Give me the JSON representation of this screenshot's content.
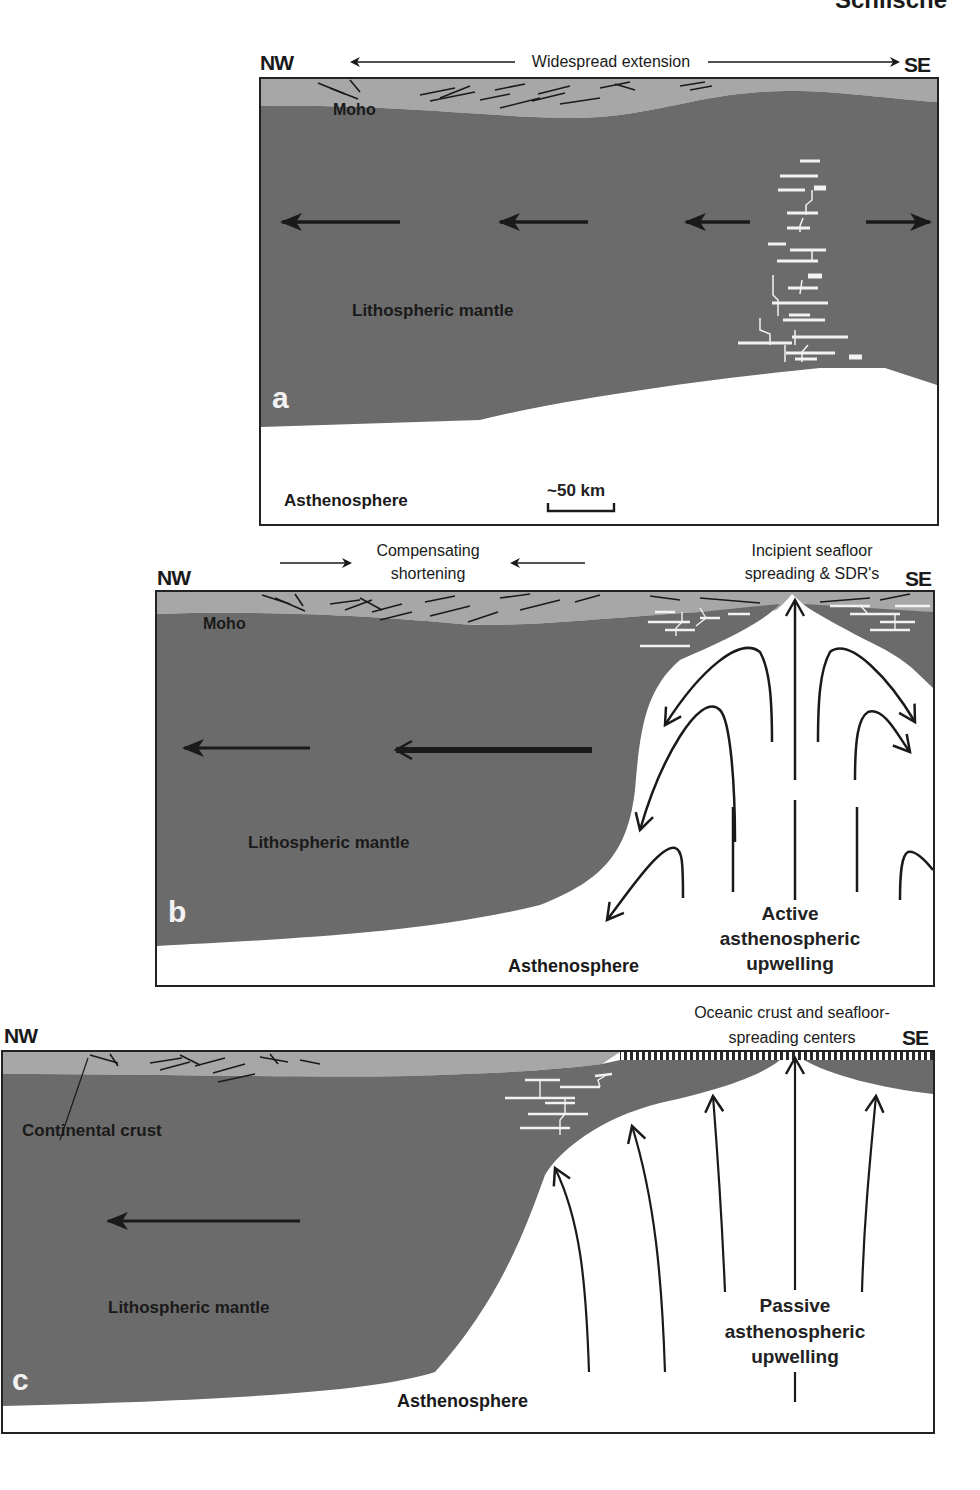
{
  "page_header_fragment": "Schlische",
  "colors": {
    "upper_crust": "#a7a7a7",
    "lithospheric_mantle": "#6b6b6b",
    "asthenosphere": "#ffffff",
    "frame": "#222222",
    "intrusion": "#f2f2f2"
  },
  "panel_a": {
    "letter": "a",
    "nw": "NW",
    "se": "SE",
    "top_label": "Widespread extension",
    "moho": "Moho",
    "mantle": "Lithospheric mantle",
    "asthenosphere": "Asthenosphere",
    "scale_bar": "~50 km"
  },
  "panel_b": {
    "letter": "b",
    "nw": "NW",
    "se": "SE",
    "shortening_line1": "Compensating",
    "shortening_line2": "shortening",
    "spreading_line1": "Incipient seafloor",
    "spreading_line2": "spreading & SDR's",
    "moho": "Moho",
    "mantle": "Lithospheric mantle",
    "asthenosphere": "Asthenosphere",
    "upwelling_line1": "Active",
    "upwelling_line2": "asthenospheric",
    "upwelling_line3": "upwelling"
  },
  "panel_c": {
    "letter": "c",
    "nw": "NW",
    "se": "SE",
    "oceanic_line1": "Oceanic crust and seafloor-",
    "oceanic_line2": "spreading centers",
    "crust": "Continental crust",
    "mantle": "Lithospheric mantle",
    "asthenosphere": "Asthenosphere",
    "upwelling_line1": "Passive",
    "upwelling_line2": "asthenospheric",
    "upwelling_line3": "upwelling"
  }
}
